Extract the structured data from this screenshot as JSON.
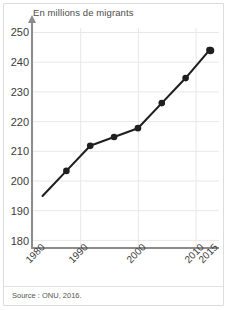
{
  "figure": {
    "title": "En millions de migrants",
    "source": "Source : ONU, 2016."
  },
  "axes": {
    "y_ticks": [
      "250",
      "240",
      "230",
      "220",
      "210",
      "200",
      "190",
      "180"
    ],
    "x_ticks": [
      "1980",
      "1990",
      "2000",
      "2010",
      "2015"
    ]
  },
  "colors": {
    "line": "#1f1f1f",
    "marker": "#1f1f1f",
    "axis": "#8c8c8c",
    "grid": "#e8e8ea",
    "text": "#3c3c3c",
    "title_text": "#4c4c4c",
    "frame": "#dcdcdc",
    "background": "#ffffff"
  },
  "chart_data": {
    "type": "line",
    "title": "En millions de migrants",
    "xlabel": "",
    "ylabel": "En millions de migrants",
    "x": [
      1980,
      1985,
      1990,
      1995,
      2000,
      2005,
      2010,
      2015
    ],
    "values": [
      195,
      203.5,
      212,
      215,
      218,
      226.5,
      235,
      244.5
    ],
    "series": [
      {
        "name": "Migrants internationaux",
        "values": [
          195,
          203.5,
          212,
          215,
          218,
          226.5,
          235,
          244.5
        ]
      }
    ],
    "xlim": [
      1978,
      2017
    ],
    "ylim": [
      178,
      252
    ],
    "y_tick_values": [
      180,
      190,
      200,
      210,
      220,
      230,
      240,
      250
    ],
    "x_tick_values": [
      1980,
      1990,
      2000,
      2010,
      2015
    ],
    "x_minor_tick_values": [
      1985,
      1995,
      2005
    ],
    "grid": true,
    "grid_axis": "both",
    "legend": false,
    "markers": true,
    "source": "Source : ONU, 2016.",
    "unit": "millions"
  }
}
